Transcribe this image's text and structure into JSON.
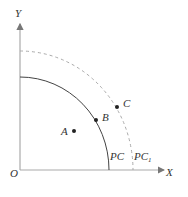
{
  "diagram": {
    "axes": {
      "x_label": "X",
      "y_label": "Y",
      "origin_label": "O"
    },
    "curves": [
      {
        "name": "PC",
        "label": "PC",
        "style": "solid"
      },
      {
        "name": "PC1",
        "label": "PC",
        "subscript": "1",
        "style": "dashed"
      }
    ],
    "points": [
      {
        "name": "A",
        "label": "A"
      },
      {
        "name": "B",
        "label": "B"
      },
      {
        "name": "C",
        "label": "C"
      }
    ],
    "colors": {
      "axis": "#999999",
      "curve": "#444444",
      "dashed": "#aaaaaa",
      "point": "#222222"
    }
  }
}
